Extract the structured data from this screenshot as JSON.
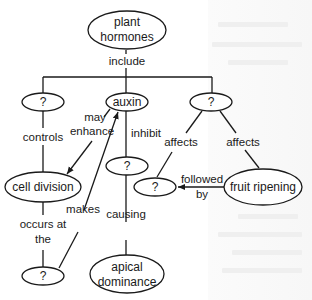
{
  "diagram": {
    "type": "concept-map",
    "nodes": {
      "root": {
        "label_line1": "plant",
        "label_line2": "hormones"
      },
      "left_unknown": {
        "label": "?"
      },
      "auxin": {
        "label": "auxin"
      },
      "right_unknown": {
        "label": "?"
      },
      "auxin_child_unknown": {
        "label": "?"
      },
      "cell_division": {
        "label": "cell division"
      },
      "affects_unknown": {
        "label": "?"
      },
      "fruit_ripening": {
        "label": "fruit ripening"
      },
      "bottom_unknown": {
        "label": "?"
      },
      "apical_dominance": {
        "label_line1": "apical",
        "label_line2": "dominance"
      }
    },
    "edges": {
      "include": {
        "label": "include",
        "from": "plant hormones",
        "to": "?, auxin, ?"
      },
      "controls": {
        "label": "controls",
        "from": "?",
        "to": "cell division"
      },
      "may_enhance": {
        "label_line1": "may",
        "label_line2": "enhance",
        "from": "auxin",
        "to": "cell division"
      },
      "inhibit": {
        "label": "inhibit",
        "from": "auxin",
        "to": "?"
      },
      "affects_left": {
        "label": "affects",
        "from": "?",
        "to": "?"
      },
      "affects_right": {
        "label": "affects",
        "from": "?",
        "to": "fruit ripening"
      },
      "followed_by": {
        "label_line1": "followed",
        "label_line2": "by",
        "from": "fruit ripening",
        "to": "?"
      },
      "occurs_at_the": {
        "label_line1": "occurs at",
        "label_line2": "the",
        "from": "cell division",
        "to": "?"
      },
      "makes": {
        "label": "makes",
        "from": "?",
        "to": "auxin"
      },
      "causing": {
        "label": "causing",
        "from": "?",
        "to": "apical dominance"
      }
    },
    "colors": {
      "ink": "#1a1a1a",
      "background": "#ffffff"
    }
  }
}
